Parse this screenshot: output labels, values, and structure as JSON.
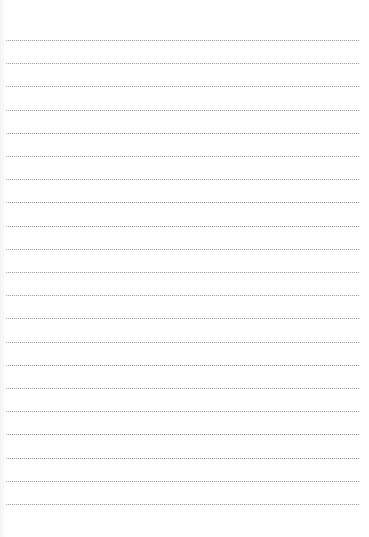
{
  "page": {
    "type": "lined-paper",
    "background_color": "#ffffff",
    "line_color": "#9a9a9a",
    "line_count": 21,
    "first_line_y": 40,
    "line_spacing": 23.2,
    "line_left": 6,
    "line_right": 359
  }
}
